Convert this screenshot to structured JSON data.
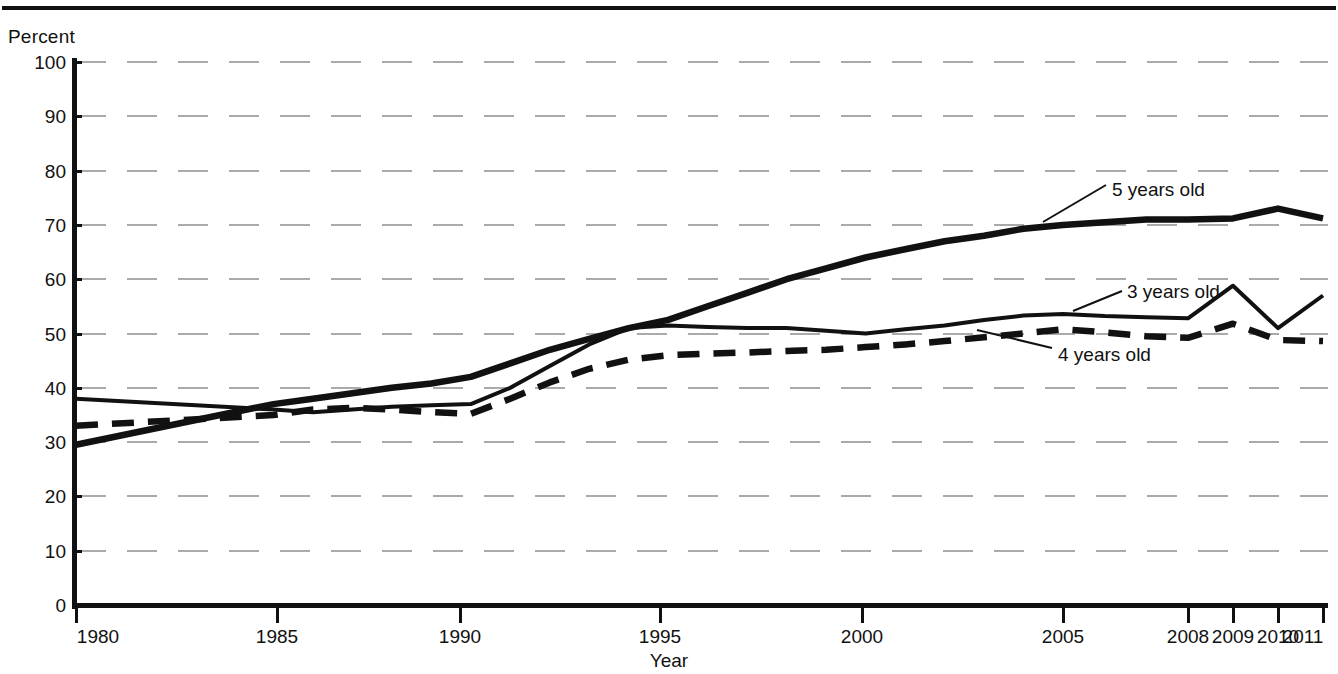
{
  "header": {
    "clipped_text": "",
    "rule": true
  },
  "axes": {
    "y_axis_label": "Percent",
    "x_axis_label": "Year",
    "y_ticks": [
      0,
      10,
      20,
      30,
      40,
      50,
      60,
      70,
      80,
      90,
      100
    ],
    "y_min": 0,
    "y_max": 100,
    "x_ticks": [
      "1980",
      "1985",
      "1990",
      "1995",
      "2000",
      "2005",
      "2008",
      "2009",
      "2010",
      "2011"
    ],
    "grid": "horizontal-dashed"
  },
  "annotations": [
    {
      "id": "annot-5",
      "label": "5 years old"
    },
    {
      "id": "annot-3",
      "label": "3 years old"
    },
    {
      "id": "annot-4",
      "label": "4 years old"
    }
  ],
  "colors": {
    "ink": "#111111",
    "grid": "#aaaaaa",
    "background": "#ffffff"
  },
  "chart_data": {
    "type": "line",
    "title": "",
    "xlabel": "Year",
    "ylabel": "Percent",
    "ylim": [
      0,
      100
    ],
    "grid": true,
    "legend": "inline-annotations",
    "x": [
      1980,
      1985,
      1986,
      1987,
      1988,
      1989,
      1990,
      1991,
      1992,
      1993,
      1994,
      1995,
      1996,
      1997,
      1998,
      1999,
      2000,
      2001,
      2002,
      2003,
      2004,
      2005,
      2006,
      2007,
      2008,
      2009,
      2010,
      2011
    ],
    "series": [
      {
        "name": "3 years old",
        "style": "solid-medium",
        "values": [
          38.0,
          36.0,
          35.5,
          36.0,
          36.5,
          36.8,
          37.0,
          40.0,
          44.0,
          48.0,
          51.0,
          51.5,
          51.2,
          51.0,
          51.0,
          50.5,
          50.0,
          50.8,
          51.5,
          52.5,
          53.3,
          53.6,
          53.2,
          53.0,
          52.8,
          58.8,
          51.0,
          57.0
        ]
      },
      {
        "name": "4 years old",
        "style": "dashed-thick",
        "values": [
          33.0,
          35.0,
          36.0,
          36.3,
          36.0,
          35.5,
          35.2,
          38.0,
          41.0,
          43.5,
          45.2,
          46.0,
          46.3,
          46.5,
          46.8,
          47.0,
          47.5,
          48.0,
          48.6,
          49.3,
          50.0,
          50.8,
          50.2,
          49.5,
          49.2,
          51.8,
          48.8,
          48.6
        ]
      },
      {
        "name": "5 years old",
        "style": "solid-thick",
        "values": [
          29.5,
          37.0,
          38.0,
          39.0,
          40.0,
          40.8,
          42.0,
          44.5,
          47.0,
          49.0,
          51.0,
          52.5,
          55.0,
          57.5,
          60.0,
          62.0,
          64.0,
          65.5,
          67.0,
          68.0,
          69.3,
          70.0,
          70.5,
          71.0,
          71.0,
          71.2,
          73.0,
          71.2
        ]
      }
    ]
  }
}
